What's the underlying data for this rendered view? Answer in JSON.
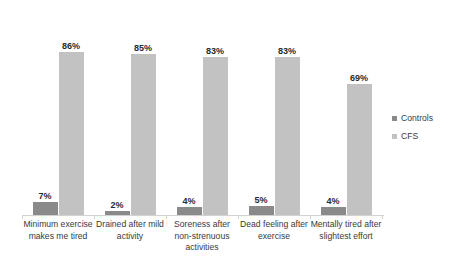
{
  "chart_data": {
    "type": "bar",
    "title": "",
    "subtitle": "",
    "xlabel": "",
    "ylabel": "",
    "ylim": [
      0,
      100
    ],
    "grid": false,
    "legend_position": "right",
    "value_suffix": "%",
    "categories": [
      "Minimum exercise makes me tired",
      "Drained after mild activity",
      "Soreness after non-strenuous activities",
      "Dead feeling after exercise",
      "Mentally tired after slightest effort"
    ],
    "series": [
      {
        "name": "Controls",
        "color": "#8a8a8a",
        "values": [
          7,
          2,
          4,
          5,
          4
        ],
        "labels": [
          "7%",
          "2%",
          "4%",
          "5%",
          "4%"
        ]
      },
      {
        "name": "CFS",
        "color": "#c2c2c2",
        "values": [
          86,
          85,
          83,
          83,
          69
        ],
        "labels": [
          "86%",
          "85%",
          "83%",
          "83%",
          "69%"
        ]
      }
    ]
  },
  "legend": {
    "items": [
      {
        "label": "Controls",
        "color": "#8a8a8a"
      },
      {
        "label": "CFS",
        "color": "#c2c2c2"
      }
    ]
  },
  "axis": {
    "line_color": "#d2d2d2"
  }
}
